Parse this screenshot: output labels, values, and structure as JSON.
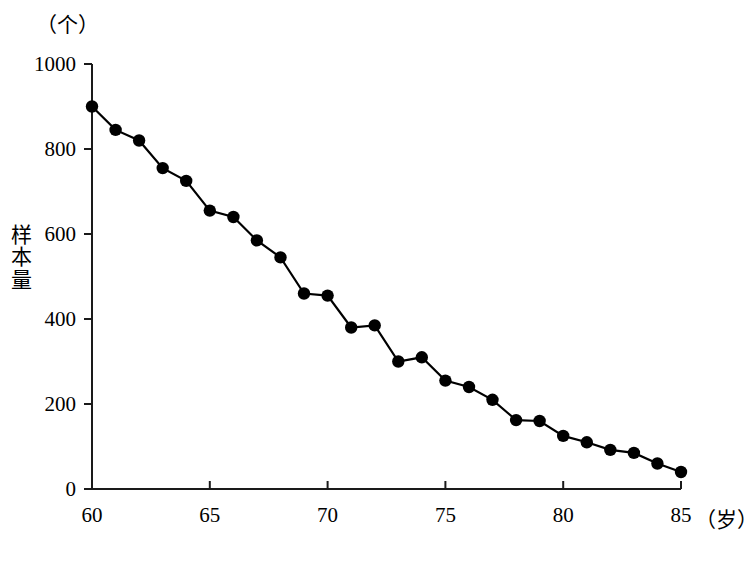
{
  "figure": {
    "y_unit_label": "（个）",
    "y_axis_title_chars": [
      "样",
      "本",
      "量"
    ],
    "x_unit_label": "（岁）"
  },
  "chart_data": {
    "type": "line",
    "title": "",
    "subtitle": "",
    "xlabel": "年龄（岁）",
    "ylabel": "样本量（个）",
    "x_unit": "（岁）",
    "y_unit": "（个）",
    "grid": false,
    "legend": "none",
    "marker": "filled-circle",
    "line_color": "#000000",
    "marker_color": "#000000",
    "xlim": [
      60,
      85
    ],
    "ylim": [
      0,
      1000
    ],
    "xticks": [
      60,
      65,
      70,
      75,
      80,
      85
    ],
    "xtick_labels": [
      "60",
      "65",
      "70",
      "75",
      "80",
      "85"
    ],
    "yticks": [
      0,
      200,
      400,
      600,
      800,
      1000
    ],
    "ytick_labels": [
      "0",
      "200",
      "400",
      "600",
      "800",
      "1000"
    ],
    "x": [
      60,
      61,
      62,
      63,
      64,
      65,
      66,
      67,
      68,
      69,
      70,
      71,
      72,
      73,
      74,
      75,
      76,
      77,
      78,
      79,
      80,
      81,
      82,
      83,
      84,
      85
    ],
    "values": [
      900,
      845,
      820,
      755,
      725,
      655,
      640,
      585,
      545,
      460,
      455,
      380,
      385,
      300,
      310,
      255,
      240,
      210,
      162,
      160,
      125,
      110,
      92,
      85,
      60,
      40
    ],
    "series": [
      {
        "name": "样本量",
        "values": [
          900,
          845,
          820,
          755,
          725,
          655,
          640,
          585,
          545,
          460,
          455,
          380,
          385,
          300,
          310,
          255,
          240,
          210,
          162,
          160,
          125,
          110,
          92,
          85,
          60,
          40
        ]
      }
    ]
  }
}
